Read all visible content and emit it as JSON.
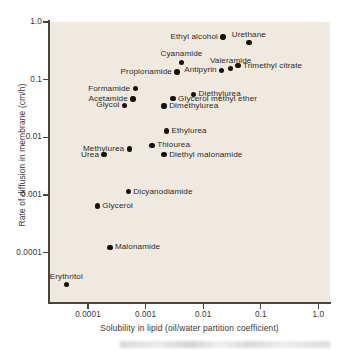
{
  "chart_data": {
    "type": "scatter",
    "title": "",
    "xlabel": "Solubility in lipid (oil/water partition coefficient)",
    "ylabel": "Rate of diffusion in membrane (cm/h)",
    "xscale": "log",
    "yscale": "log",
    "xlim": [
      3e-05,
      1.0
    ],
    "ylim": [
      2e-05,
      1.0
    ],
    "grid": false,
    "legend": "none",
    "background_color": "#f0e9df",
    "marker_color": "#17120f",
    "axis_color": "#4a4440",
    "xticks": [
      {
        "value": 0.0001,
        "label": "0.0001"
      },
      {
        "value": 0.001,
        "label": "0.001"
      },
      {
        "value": 0.01,
        "label": "0.01"
      },
      {
        "value": 0.1,
        "label": "0.1"
      },
      {
        "value": 1.0,
        "label": "1.0"
      }
    ],
    "yticks": [
      {
        "value": 1.0,
        "label": "1.0"
      },
      {
        "value": 0.1,
        "label": "0.1"
      },
      {
        "value": 0.01,
        "label": "0.01"
      },
      {
        "value": 0.001,
        "label": "0.001"
      },
      {
        "value": 0.0001,
        "label": "0.0001"
      }
    ],
    "points": [
      {
        "label": "Ethyl alcohol",
        "x": 0.022,
        "y": 0.55,
        "label_pos": "left"
      },
      {
        "label": "Urethane",
        "x": 0.062,
        "y": 0.44,
        "label_pos": "above"
      },
      {
        "label": "Cyanamide",
        "x": 0.0042,
        "y": 0.2,
        "label_pos": "above"
      },
      {
        "label": "Antipyrin",
        "x": 0.021,
        "y": 0.145,
        "label_pos": "left"
      },
      {
        "label": "Trimethyl citrate",
        "x": 0.04,
        "y": 0.175,
        "label_pos": "right"
      },
      {
        "label": "Valeramide",
        "x": 0.03,
        "y": 0.155,
        "label_pos": "above"
      },
      {
        "label": "Propionamide",
        "x": 0.0035,
        "y": 0.135,
        "label_pos": "left"
      },
      {
        "label": "Formamide",
        "x": 0.00066,
        "y": 0.07,
        "label_pos": "left"
      },
      {
        "label": "Acetamide",
        "x": 0.0006,
        "y": 0.046,
        "label_pos": "left"
      },
      {
        "label": "Glycol",
        "x": 0.00043,
        "y": 0.036,
        "label_pos": "left"
      },
      {
        "label": "Diethylurea",
        "x": 0.0068,
        "y": 0.056,
        "label_pos": "right"
      },
      {
        "label": "Glycerol methyl ether",
        "x": 0.003,
        "y": 0.047,
        "label_pos": "right"
      },
      {
        "label": "Dimethylurea",
        "x": 0.0021,
        "y": 0.035,
        "label_pos": "right"
      },
      {
        "label": "Ethylurea",
        "x": 0.0023,
        "y": 0.013,
        "label_pos": "right"
      },
      {
        "label": "Thiourea",
        "x": 0.0013,
        "y": 0.0073,
        "label_pos": "right"
      },
      {
        "label": "Methylurea",
        "x": 0.00052,
        "y": 0.0063,
        "label_pos": "left"
      },
      {
        "label": "Urea",
        "x": 0.00019,
        "y": 0.005,
        "label_pos": "left"
      },
      {
        "label": "Diethyl malonamide",
        "x": 0.0021,
        "y": 0.005,
        "label_pos": "right"
      },
      {
        "label": "Dicyanodiamide",
        "x": 0.0005,
        "y": 0.00115,
        "label_pos": "right"
      },
      {
        "label": "Glycerol",
        "x": 0.000145,
        "y": 0.00065,
        "label_pos": "right"
      },
      {
        "label": "Malonamide",
        "x": 0.00024,
        "y": 0.000125,
        "label_pos": "right"
      },
      {
        "label": "Erythritol",
        "x": 4.2e-05,
        "y": 2.8e-05,
        "label_pos": "above"
      }
    ]
  }
}
